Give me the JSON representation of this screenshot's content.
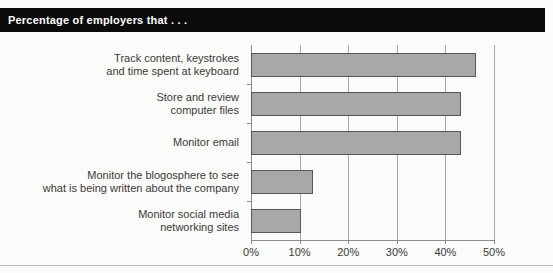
{
  "banner": {
    "title": "Percentage of employers that . . ."
  },
  "colors": {
    "banner_background": "#0b0b0b",
    "banner_text": "#ffffff",
    "bar_fill": "#a8a8a8",
    "bar_border": "#575757",
    "gridline": "#a6a6a6",
    "axis": "#8a8a8a",
    "label_text": "#3a3a3a",
    "page_background": "#fbfbf9"
  },
  "chart_data": {
    "type": "bar",
    "orientation": "horizontal",
    "title": "Percentage of employers that . . .",
    "xlabel": "",
    "ylabel": "",
    "xlim": [
      0,
      50
    ],
    "grid": true,
    "legend": false,
    "categories": [
      "Track content, keystrokes\nand time spent at keyboard",
      "Store and review\ncomputer files",
      "Monitor email",
      "Monitor the blogosphere to see\nwhat is being written about the company",
      "Monitor social media\nnetworking sites"
    ],
    "values": [
      46,
      43,
      43,
      12.5,
      10
    ],
    "xticks": [
      0,
      10,
      20,
      30,
      40,
      50
    ],
    "xtick_labels": [
      "0%",
      "10%",
      "20%",
      "30%",
      "40%",
      "50%"
    ]
  }
}
